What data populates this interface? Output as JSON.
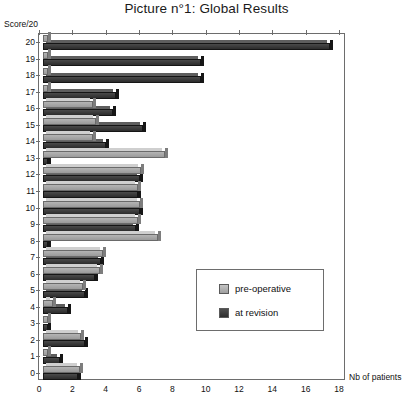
{
  "chart_data": {
    "type": "bar",
    "orientation": "horizontal",
    "title": "Picture n°1: Global Results",
    "xlabel": "Nb of patients",
    "ylabel": "Score/20",
    "xlim": [
      0,
      18
    ],
    "xticks": [
      0,
      2,
      4,
      6,
      8,
      10,
      12,
      14,
      16,
      18
    ],
    "categories": [
      "20",
      "19",
      "18",
      "17",
      "16",
      "15",
      "14",
      "13",
      "12",
      "11",
      "10",
      "9",
      "8",
      "7",
      "6",
      "5",
      "4",
      "3",
      "2",
      "1",
      "0"
    ],
    "grid": false,
    "legend_position": "center-right-inside",
    "series": [
      {
        "name": "pre-operative",
        "color": "#b0b0b0",
        "values": [
          0.3,
          0.3,
          0.3,
          0.3,
          3.0,
          3.2,
          3.0,
          7.3,
          5.9,
          5.7,
          5.8,
          5.7,
          6.9,
          3.6,
          3.4,
          2.4,
          0.6,
          0.3,
          2.3,
          0.3,
          2.2
        ]
      },
      {
        "name": "at revision",
        "color": "#333333",
        "values": [
          17.2,
          9.5,
          9.5,
          4.4,
          4.2,
          6.0,
          3.8,
          0.3,
          5.8,
          5.7,
          5.8,
          5.6,
          0.3,
          3.5,
          3.1,
          2.5,
          1.5,
          0.3,
          2.5,
          1.0,
          2.1
        ]
      }
    ]
  },
  "legend": {
    "items": [
      {
        "label": "pre-operative"
      },
      {
        "label": "at revision"
      }
    ]
  }
}
